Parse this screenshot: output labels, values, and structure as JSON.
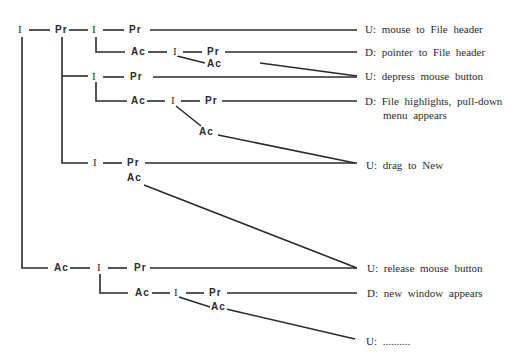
{
  "diagram": {
    "title": "",
    "nodes": {
      "r1_i0": "I",
      "r1_pr0": "Pr",
      "r1_i1": "I",
      "r1_pr1": "Pr",
      "r2_ac": "Ac",
      "r2_i": "I",
      "r2_pr": "Pr",
      "r2_ac2": "Ac",
      "r3_i": "I",
      "r3_pr": "Pr",
      "r4_ac": "Ac",
      "r4_i": "I",
      "r4_pr": "Pr",
      "r4_ac2": "Ac",
      "r5_i": "I",
      "r5_pr": "Pr",
      "r5_ac": "Ac",
      "r6_ac": "Ac",
      "r6_i": "I",
      "r6_pr": "Pr",
      "r7_ac": "Ac",
      "r7_i": "I",
      "r7_pr": "Pr",
      "r7_ac2": "Ac"
    },
    "labels": [
      {
        "text": "U:  mouse to File header"
      },
      {
        "text": "D:  pointer to File header"
      },
      {
        "text": "U:  depress mouse button"
      },
      {
        "text": "D:  File highlights, pull-down",
        "text2": "menu appears"
      },
      {
        "text": "U:  drag to New"
      },
      {
        "text": "U:  release mouse button"
      },
      {
        "text": "D:  new window appears"
      },
      {
        "text": "U:  .........."
      }
    ],
    "legend": {
      "I": "I",
      "Pr": "Pr",
      "Ac": "Ac",
      "U": "U",
      "D": "D"
    }
  }
}
